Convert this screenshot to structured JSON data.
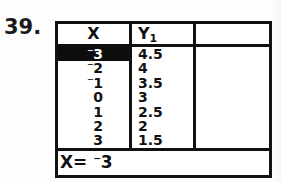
{
  "problem": {
    "number": "39."
  },
  "calculator": {
    "device_style": "ti-graphing-calculator-table",
    "table": {
      "columns": [
        {
          "key": "x",
          "label": "X",
          "sublabel": ""
        },
        {
          "key": "y1",
          "label": "Y",
          "sublabel": "1"
        },
        {
          "key": "c3",
          "label": "",
          "sublabel": ""
        }
      ],
      "rows": [
        {
          "x_sign": "⁻",
          "x": "3",
          "y1": "4.5",
          "selected": true
        },
        {
          "x_sign": "⁻",
          "x": "2",
          "y1": "4",
          "selected": false
        },
        {
          "x_sign": "⁻",
          "x": "1",
          "y1": "3.5",
          "selected": false
        },
        {
          "x_sign": "",
          "x": "0",
          "y1": "3",
          "selected": false
        },
        {
          "x_sign": "",
          "x": "1",
          "y1": "2.5",
          "selected": false
        },
        {
          "x_sign": "",
          "x": "2",
          "y1": "2",
          "selected": false
        },
        {
          "x_sign": "",
          "x": "3",
          "y1": "1.5",
          "selected": false
        }
      ]
    },
    "status_bar": {
      "prefix": "X=",
      "sign": "⁻",
      "value": "3"
    }
  },
  "colors": {
    "ink": "#111111",
    "paper": "#ffffff",
    "highlight_bg": "#0d0d0d",
    "highlight_fg": "#ffffff"
  },
  "chart_data": {
    "type": "table",
    "title": "",
    "xlabel": "X",
    "ylabel": "Y1",
    "categories": [
      "-3",
      "-2",
      "-1",
      "0",
      "1",
      "2",
      "3"
    ],
    "x": [
      -3,
      -2,
      -1,
      0,
      1,
      2,
      3
    ],
    "series": [
      {
        "name": "Y1",
        "values": [
          4.5,
          4,
          3.5,
          3,
          2.5,
          2,
          1.5
        ]
      }
    ],
    "selected_index": 0,
    "grid": true,
    "legend": "none"
  }
}
